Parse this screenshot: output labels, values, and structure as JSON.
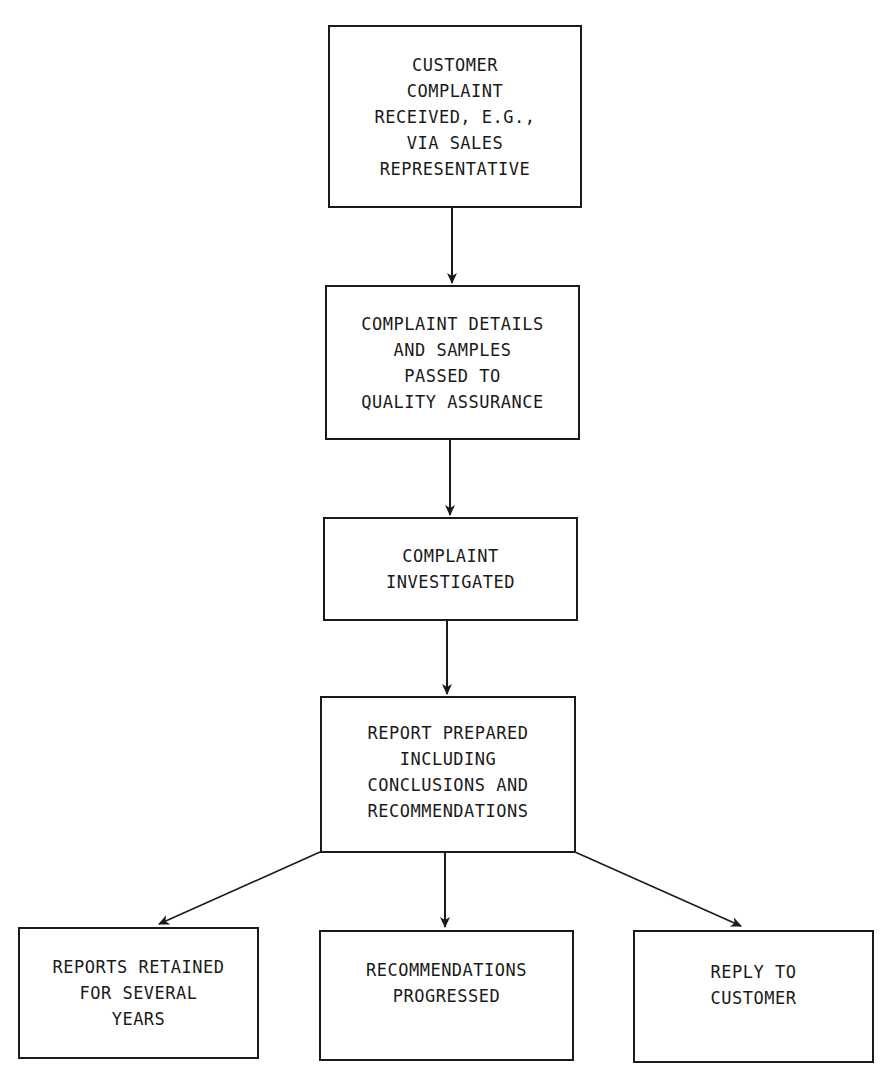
{
  "diagram": {
    "type": "flowchart",
    "nodes": [
      {
        "id": "n1",
        "lines": [
          "CUSTOMER",
          "COMPLAINT",
          "RECEIVED, E.G.,",
          "VIA SALES",
          "REPRESENTATIVE"
        ]
      },
      {
        "id": "n2",
        "lines": [
          "COMPLAINT DETAILS",
          "AND SAMPLES",
          "PASSED TO",
          "QUALITY ASSURANCE"
        ]
      },
      {
        "id": "n3",
        "lines": [
          "COMPLAINT",
          "INVESTIGATED"
        ]
      },
      {
        "id": "n4",
        "lines": [
          "REPORT PREPARED",
          "INCLUDING",
          "CONCLUSIONS AND",
          "RECOMMENDATIONS"
        ]
      },
      {
        "id": "n5",
        "lines": [
          "REPORTS RETAINED",
          "FOR SEVERAL",
          "YEARS"
        ]
      },
      {
        "id": "n6",
        "lines": [
          "RECOMMENDATIONS",
          "PROGRESSED"
        ]
      },
      {
        "id": "n7",
        "lines": [
          "REPLY TO",
          "CUSTOMER"
        ]
      }
    ],
    "edges": [
      {
        "from": "n1",
        "to": "n2"
      },
      {
        "from": "n2",
        "to": "n3"
      },
      {
        "from": "n3",
        "to": "n4"
      },
      {
        "from": "n4",
        "to": "n5"
      },
      {
        "from": "n4",
        "to": "n6"
      },
      {
        "from": "n4",
        "to": "n7"
      }
    ],
    "colors": {
      "stroke": "#1a1a1a",
      "background": "#ffffff"
    }
  }
}
